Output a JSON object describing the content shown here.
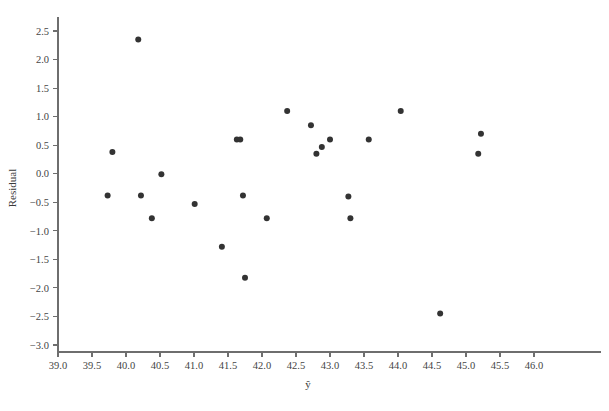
{
  "chart_data": {
    "type": "scatter",
    "title": "",
    "subtitle": "",
    "xlabel": "ŷ",
    "ylabel": "Residual",
    "xlim": [
      39.0,
      46.0
    ],
    "ylim": [
      -3.0,
      2.5
    ],
    "xticks": [
      "39.0",
      "39.5",
      "40.0",
      "40.5",
      "41.0",
      "41.5",
      "42.0",
      "42.5",
      "43.0",
      "43.5",
      "44.0",
      "44.5",
      "45.0",
      "45.5",
      "46.0"
    ],
    "xtick_values": [
      39.0,
      39.5,
      40.0,
      40.5,
      41.0,
      41.5,
      42.0,
      42.5,
      43.0,
      43.5,
      44.0,
      44.5,
      45.0,
      45.5,
      46.0
    ],
    "yticks": [
      "2.5",
      "2.0",
      "1.5",
      "1.0",
      "0.5",
      "0.0",
      "−0.5",
      "−1.0",
      "−1.5",
      "−2.0",
      "−2.5",
      "−3.0"
    ],
    "ytick_values": [
      2.5,
      2.0,
      1.5,
      1.0,
      0.5,
      0.0,
      -0.5,
      -1.0,
      -1.5,
      -2.0,
      -2.5,
      -3.0
    ],
    "grid": false,
    "legend": false,
    "legend_position": "none",
    "marker_color": "#333333",
    "marker_size": 3.0,
    "axis_color": "#6e6e6e",
    "background_color": "#ffffff",
    "x": [
      39.73,
      39.8,
      40.18,
      40.22,
      40.38,
      40.52,
      41.01,
      41.41,
      41.63,
      41.68,
      41.72,
      41.75,
      42.07,
      42.37,
      42.72,
      42.8,
      42.88,
      43.0,
      43.27,
      43.3,
      43.57,
      44.04,
      44.62,
      45.18,
      45.22
    ],
    "y": [
      -0.38,
      0.38,
      2.35,
      -0.38,
      -0.78,
      -0.01,
      -0.53,
      -1.28,
      0.6,
      0.6,
      -0.38,
      -1.82,
      -0.78,
      1.1,
      0.85,
      0.35,
      0.47,
      0.6,
      -0.4,
      -0.78,
      0.6,
      1.1,
      -2.45,
      0.35,
      0.7
    ],
    "points": [
      {
        "x": 39.73,
        "y": -0.38
      },
      {
        "x": 39.8,
        "y": 0.38
      },
      {
        "x": 40.18,
        "y": 2.35
      },
      {
        "x": 40.22,
        "y": -0.38
      },
      {
        "x": 40.38,
        "y": -0.78
      },
      {
        "x": 40.52,
        "y": -0.01
      },
      {
        "x": 41.01,
        "y": -0.53
      },
      {
        "x": 41.41,
        "y": -1.28
      },
      {
        "x": 41.63,
        "y": 0.6
      },
      {
        "x": 41.68,
        "y": 0.6
      },
      {
        "x": 41.72,
        "y": -0.38
      },
      {
        "x": 41.75,
        "y": -1.82
      },
      {
        "x": 42.07,
        "y": -0.78
      },
      {
        "x": 42.37,
        "y": 1.1
      },
      {
        "x": 42.72,
        "y": 0.85
      },
      {
        "x": 42.8,
        "y": 0.35
      },
      {
        "x": 42.88,
        "y": 0.47
      },
      {
        "x": 43.0,
        "y": 0.6
      },
      {
        "x": 43.27,
        "y": -0.4
      },
      {
        "x": 43.3,
        "y": -0.78
      },
      {
        "x": 43.57,
        "y": 0.6
      },
      {
        "x": 44.04,
        "y": 1.1
      },
      {
        "x": 44.62,
        "y": -2.45
      },
      {
        "x": 45.18,
        "y": 0.35
      },
      {
        "x": 45.22,
        "y": 0.7
      }
    ]
  },
  "figure": {
    "n_points": 25
  }
}
